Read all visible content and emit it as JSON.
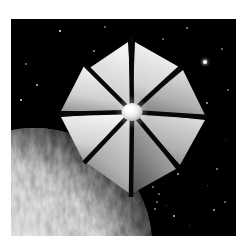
{
  "image": {
    "title": "Solar sail spacecraft above a cloud-covered planet",
    "medium": "grayscale space illustration",
    "frame": {
      "page_background": "#ffffff",
      "photo_background": "#000000",
      "photo_rect": {
        "x": 11,
        "y": 19,
        "width": 225,
        "height": 217
      }
    }
  },
  "scene": {
    "background_label": "deep space starfield",
    "colors": {
      "space_black": "#000000",
      "star_white": "#ffffff",
      "sail_bright": "#f2f2f2",
      "sail_mid": "#b9b9b9",
      "sail_dark": "#6e6e6e",
      "spar_black": "#060606",
      "hub_white": "#fdfdfd",
      "planet_light": "#e8e8e8",
      "planet_mid": "#9a9a9a",
      "planet_dark": "#2a2a2a"
    }
  },
  "spacecraft": {
    "name": "solar-sail",
    "label": "octagonal solar sail",
    "panel_count": 8,
    "hub": {
      "cx": 132,
      "cy": 112,
      "r": 11,
      "label": "central hub"
    },
    "outer_radius": 78,
    "panels": [
      {
        "index": 0,
        "label": "sail-panel-1",
        "a0": -112,
        "a1": -68,
        "shade": "bright"
      },
      {
        "index": 1,
        "label": "sail-panel-2",
        "a0": -66,
        "a1": -22,
        "shade": "bright"
      },
      {
        "index": 2,
        "label": "sail-panel-3",
        "a0": -20,
        "a1": 24,
        "shade": "mid"
      },
      {
        "index": 3,
        "label": "sail-panel-4",
        "a0": 26,
        "a1": 70,
        "shade": "mid"
      },
      {
        "index": 4,
        "label": "sail-panel-5",
        "a0": 72,
        "a1": 116,
        "shade": "dark"
      },
      {
        "index": 5,
        "label": "sail-panel-6",
        "a0": 118,
        "a1": 162,
        "shade": "mid"
      },
      {
        "index": 6,
        "label": "sail-panel-7",
        "a0": 164,
        "a1": 208,
        "shade": "bright"
      },
      {
        "index": 7,
        "label": "sail-panel-8",
        "a0": 210,
        "a1": 254,
        "shade": "bright"
      }
    ],
    "spars": [
      {
        "label": "spar-1",
        "angle": -90
      },
      {
        "label": "spar-2",
        "angle": -45
      },
      {
        "label": "spar-3",
        "angle": 0
      },
      {
        "label": "spar-4",
        "angle": 45
      },
      {
        "label": "spar-5",
        "angle": 90
      },
      {
        "label": "spar-6",
        "angle": 135
      },
      {
        "label": "spar-7",
        "angle": 180
      },
      {
        "label": "spar-8",
        "angle": 225
      }
    ]
  },
  "planet": {
    "label": "cloud-covered planet",
    "cx": 34,
    "cy": 246,
    "r": 118,
    "terminator": "upper-right limb fades to shadow"
  },
  "stars": [
    {
      "x": 49,
      "y": 12,
      "r": 1.4,
      "b": 0.95
    },
    {
      "x": 83,
      "y": 32,
      "r": 0.8,
      "b": 0.55
    },
    {
      "x": 26,
      "y": 66,
      "r": 1.1,
      "b": 0.8
    },
    {
      "x": 10,
      "y": 81,
      "r": 1.2,
      "b": 0.85
    },
    {
      "x": 15,
      "y": 45,
      "r": 0.7,
      "b": 0.45
    },
    {
      "x": 62,
      "y": 96,
      "r": 0.6,
      "b": 0.4
    },
    {
      "x": 120,
      "y": 28,
      "r": 0.7,
      "b": 0.5
    },
    {
      "x": 152,
      "y": 20,
      "r": 0.6,
      "b": 0.4
    },
    {
      "x": 176,
      "y": 9,
      "r": 0.9,
      "b": 0.6
    },
    {
      "x": 194,
      "y": 43,
      "r": 2.0,
      "b": 1.0
    },
    {
      "x": 196,
      "y": 84,
      "r": 1.0,
      "b": 0.7
    },
    {
      "x": 184,
      "y": 117,
      "r": 1.1,
      "b": 0.75
    },
    {
      "x": 211,
      "y": 30,
      "r": 0.7,
      "b": 0.45
    },
    {
      "x": 217,
      "y": 71,
      "r": 0.6,
      "b": 0.4
    },
    {
      "x": 206,
      "y": 150,
      "r": 0.8,
      "b": 0.5
    },
    {
      "x": 167,
      "y": 155,
      "r": 1.0,
      "b": 0.7
    },
    {
      "x": 142,
      "y": 168,
      "r": 0.7,
      "b": 0.45
    },
    {
      "x": 148,
      "y": 175,
      "r": 0.6,
      "b": 0.4
    },
    {
      "x": 146,
      "y": 183,
      "r": 0.6,
      "b": 0.4
    },
    {
      "x": 155,
      "y": 186,
      "r": 0.5,
      "b": 0.35
    },
    {
      "x": 144,
      "y": 190,
      "r": 0.6,
      "b": 0.45
    },
    {
      "x": 163,
      "y": 197,
      "r": 1.1,
      "b": 0.8
    },
    {
      "x": 203,
      "y": 191,
      "r": 1.0,
      "b": 0.7
    },
    {
      "x": 214,
      "y": 183,
      "r": 0.6,
      "b": 0.4
    },
    {
      "x": 178,
      "y": 206,
      "r": 0.5,
      "b": 0.35
    },
    {
      "x": 196,
      "y": 166,
      "r": 0.5,
      "b": 0.35
    },
    {
      "x": 125,
      "y": 193,
      "r": 0.5,
      "b": 0.35
    },
    {
      "x": 94,
      "y": 8,
      "r": 0.6,
      "b": 0.4
    },
    {
      "x": 33,
      "y": 126,
      "r": 0.6,
      "b": 0.4
    },
    {
      "x": 214,
      "y": 121,
      "r": 0.5,
      "b": 0.35
    }
  ]
}
